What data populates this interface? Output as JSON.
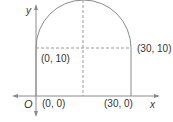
{
  "diagram": {
    "axes": {
      "x_label": "x",
      "y_label": "y",
      "origin_label": "O"
    },
    "points": [
      {
        "id": "p00",
        "label": "(0, 0)"
      },
      {
        "id": "p300",
        "label": "(30, 0)"
      },
      {
        "id": "p010",
        "label": "(0, 10)"
      },
      {
        "id": "p3010",
        "label": "(30, 10)"
      }
    ],
    "shape": "rectangle with semicircular top (arch)",
    "colors": {
      "line": "#8a8a8a",
      "dashed": "#9a9a9a",
      "text": "#333333"
    }
  }
}
